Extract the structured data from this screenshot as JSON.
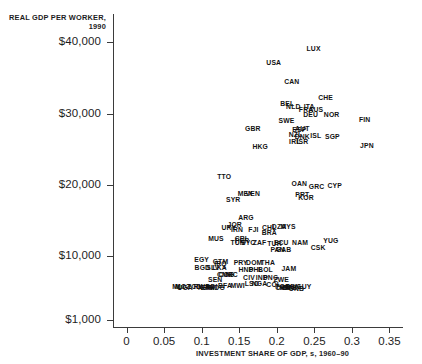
{
  "chart_data": {
    "type": "scatter",
    "title": "",
    "xlabel": "INVESTMENT SHARE OF GDP, s, 1960–90",
    "ylabel": "REAL GDP PER WORKER, 1990",
    "xlim": [
      -0.018,
      0.368
    ],
    "ylim": [
      0,
      44000
    ],
    "grid": false,
    "legend": false,
    "point_style": "text-label",
    "xticks": [
      "0",
      "0.05",
      "0.1",
      "0.15",
      "0.2",
      "0.25",
      "0.3",
      "0.35"
    ],
    "xtickvalues": [
      0,
      0.05,
      0.1,
      0.15,
      0.2,
      0.25,
      0.3,
      0.35
    ],
    "yticks": [
      "$40,000",
      "$30,000",
      "$20,000",
      "$10,000",
      "$1,000"
    ],
    "ytickvalues": [
      40000,
      30000,
      20000,
      10000,
      1000
    ],
    "points": [
      {
        "label": "LUX",
        "x": 0.249,
        "y": 39200
      },
      {
        "label": "USA",
        "x": 0.196,
        "y": 37300
      },
      {
        "label": "CAN",
        "x": 0.22,
        "y": 34600
      },
      {
        "label": "CHE",
        "x": 0.265,
        "y": 32400
      },
      {
        "label": "BEL",
        "x": 0.214,
        "y": 31500
      },
      {
        "label": "NLD",
        "x": 0.222,
        "y": 31100
      },
      {
        "label": "ITA",
        "x": 0.243,
        "y": 31100
      },
      {
        "label": "FRA",
        "x": 0.239,
        "y": 30700
      },
      {
        "label": "AUS",
        "x": 0.252,
        "y": 30700
      },
      {
        "label": "DEU",
        "x": 0.245,
        "y": 30000
      },
      {
        "label": "NOR",
        "x": 0.273,
        "y": 30000
      },
      {
        "label": "FIN",
        "x": 0.317,
        "y": 29200
      },
      {
        "label": "SWE",
        "x": 0.213,
        "y": 29100
      },
      {
        "label": "AUT",
        "x": 0.234,
        "y": 28000
      },
      {
        "label": "ESP",
        "x": 0.23,
        "y": 27900
      },
      {
        "label": "GBR",
        "x": 0.168,
        "y": 28000
      },
      {
        "label": "NZL",
        "x": 0.225,
        "y": 27200
      },
      {
        "label": "DNK",
        "x": 0.234,
        "y": 26900
      },
      {
        "label": "ISL",
        "x": 0.252,
        "y": 27000
      },
      {
        "label": "SGP",
        "x": 0.274,
        "y": 26800
      },
      {
        "label": "IRL",
        "x": 0.224,
        "y": 26200
      },
      {
        "label": "ISR",
        "x": 0.234,
        "y": 26100
      },
      {
        "label": "JPN",
        "x": 0.32,
        "y": 25600
      },
      {
        "label": "HKG",
        "x": 0.178,
        "y": 25400
      },
      {
        "label": "TTO",
        "x": 0.13,
        "y": 21200
      },
      {
        "label": "OAN",
        "x": 0.23,
        "y": 20200
      },
      {
        "label": "GRC",
        "x": 0.253,
        "y": 19800
      },
      {
        "label": "CYP",
        "x": 0.277,
        "y": 19900
      },
      {
        "label": "PRT",
        "x": 0.234,
        "y": 18700
      },
      {
        "label": "KOR",
        "x": 0.239,
        "y": 18300
      },
      {
        "label": "MEX",
        "x": 0.158,
        "y": 18900
      },
      {
        "label": "VEN",
        "x": 0.168,
        "y": 18900
      },
      {
        "label": "SYR",
        "x": 0.142,
        "y": 18000
      },
      {
        "label": "ARG",
        "x": 0.159,
        "y": 15500
      },
      {
        "label": "JOR",
        "x": 0.144,
        "y": 14500
      },
      {
        "label": "URY",
        "x": 0.136,
        "y": 14000
      },
      {
        "label": "IRN",
        "x": 0.147,
        "y": 13800
      },
      {
        "label": "FJI",
        "x": 0.169,
        "y": 13800
      },
      {
        "label": "CHL",
        "x": 0.19,
        "y": 14000
      },
      {
        "label": "BRA",
        "x": 0.19,
        "y": 13400
      },
      {
        "label": "DZA",
        "x": 0.203,
        "y": 14200
      },
      {
        "label": "MYS",
        "x": 0.215,
        "y": 14200
      },
      {
        "label": "MUS",
        "x": 0.119,
        "y": 12500
      },
      {
        "label": "CRI",
        "x": 0.152,
        "y": 12500
      },
      {
        "label": "PER",
        "x": 0.154,
        "y": 12200
      },
      {
        "label": "TUN",
        "x": 0.148,
        "y": 11900
      },
      {
        "label": "SYC",
        "x": 0.162,
        "y": 11900
      },
      {
        "label": "ZAF",
        "x": 0.177,
        "y": 12000
      },
      {
        "label": "TUR",
        "x": 0.197,
        "y": 11800
      },
      {
        "label": "ECU",
        "x": 0.206,
        "y": 11900
      },
      {
        "label": "NAM",
        "x": 0.231,
        "y": 11900
      },
      {
        "label": "YUG",
        "x": 0.272,
        "y": 12300
      },
      {
        "label": "CSK",
        "x": 0.255,
        "y": 11200
      },
      {
        "label": "PAN",
        "x": 0.201,
        "y": 11000
      },
      {
        "label": "GAB",
        "x": 0.209,
        "y": 11000
      },
      {
        "label": "EGY",
        "x": 0.1,
        "y": 9600
      },
      {
        "label": "BGD",
        "x": 0.101,
        "y": 8400
      },
      {
        "label": "GTM",
        "x": 0.125,
        "y": 9300
      },
      {
        "label": "IRQ",
        "x": 0.125,
        "y": 9000
      },
      {
        "label": "PRY",
        "x": 0.152,
        "y": 9200
      },
      {
        "label": "DOM",
        "x": 0.17,
        "y": 9200
      },
      {
        "label": "THA",
        "x": 0.188,
        "y": 9200
      },
      {
        "label": "SLV",
        "x": 0.115,
        "y": 8500
      },
      {
        "label": "LKA",
        "x": 0.124,
        "y": 8500
      },
      {
        "label": "HND",
        "x": 0.159,
        "y": 8200
      },
      {
        "label": "PHL",
        "x": 0.172,
        "y": 8200
      },
      {
        "label": "BOL",
        "x": 0.185,
        "y": 8200
      },
      {
        "label": "JAM",
        "x": 0.216,
        "y": 8300
      },
      {
        "label": "CMR",
        "x": 0.131,
        "y": 7400
      },
      {
        "label": "NIC",
        "x": 0.14,
        "y": 7400
      },
      {
        "label": "COG",
        "x": 0.133,
        "y": 7400
      },
      {
        "label": "CIV",
        "x": 0.163,
        "y": 7000
      },
      {
        "label": "IND",
        "x": 0.18,
        "y": 7000
      },
      {
        "label": "PNG",
        "x": 0.192,
        "y": 7000
      },
      {
        "label": "ZWE",
        "x": 0.206,
        "y": 6800
      },
      {
        "label": "CHN",
        "x": 0.208,
        "y": 5600
      },
      {
        "label": "ZMB",
        "x": 0.217,
        "y": 5600
      },
      {
        "label": "GUY",
        "x": 0.236,
        "y": 5700
      },
      {
        "label": "SEN",
        "x": 0.118,
        "y": 6700
      },
      {
        "label": "LSO",
        "x": 0.167,
        "y": 6200
      },
      {
        "label": "NGA",
        "x": 0.177,
        "y": 6200
      },
      {
        "label": "COL",
        "x": 0.196,
        "y": 6000
      },
      {
        "label": "MWI",
        "x": 0.148,
        "y": 5900
      },
      {
        "label": "BFA",
        "x": 0.131,
        "y": 5900
      },
      {
        "label": "BDI",
        "x": 0.113,
        "y": 5800
      },
      {
        "label": "TCD",
        "x": 0.09,
        "y": 5700
      },
      {
        "label": "MOZ",
        "x": 0.075,
        "y": 5700
      },
      {
        "label": "UGA",
        "x": 0.078,
        "y": 5600
      },
      {
        "label": "RWA",
        "x": 0.1,
        "y": 5700
      },
      {
        "label": "MLI",
        "x": 0.069,
        "y": 5700
      },
      {
        "label": "NER",
        "x": 0.105,
        "y": 5600
      },
      {
        "label": "ETH",
        "x": 0.108,
        "y": 5600
      },
      {
        "label": "MDG",
        "x": 0.12,
        "y": 5600
      },
      {
        "label": "KEN",
        "x": 0.213,
        "y": 5600
      },
      {
        "label": "GNB",
        "x": 0.226,
        "y": 5500
      },
      {
        "label": "BEN",
        "x": 0.221,
        "y": 5700
      },
      {
        "label": "TGO",
        "x": 0.208,
        "y": 5700
      }
    ]
  },
  "axes": {
    "y_title": "REAL GDP PER WORKER, 1990",
    "x_title": "INVESTMENT SHARE OF GDP, s, 1960–90"
  }
}
